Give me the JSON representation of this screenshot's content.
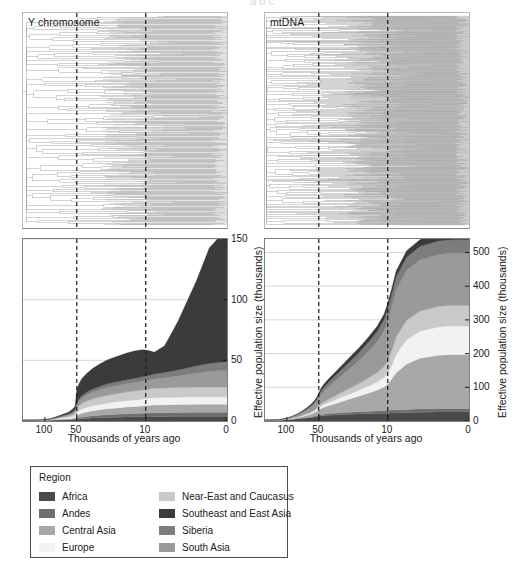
{
  "figure": {
    "cropped_header_text": "a  b  c",
    "panels": [
      {
        "id": "y",
        "title": "Y chromosome"
      },
      {
        "id": "mt",
        "title": "mtDNA"
      }
    ]
  },
  "axes": {
    "xlabel": "Thousands of years ago",
    "ylabel": "Effective population size (thousands)",
    "xticks": [
      "100",
      "50",
      "10",
      "0"
    ],
    "xtick_values": [
      100,
      50,
      10,
      0
    ],
    "left_yticks": [
      "0",
      "50",
      "100",
      "150"
    ],
    "right_yticks": [
      "0",
      "100",
      "200",
      "300",
      "400",
      "500"
    ],
    "dashed_marker_values": [
      50,
      10
    ]
  },
  "legend": {
    "title": "Region",
    "left_column": [
      {
        "label": "Africa",
        "color": "#4a4a4a"
      },
      {
        "label": "Andes",
        "color": "#6f6f6f"
      },
      {
        "label": "Central Asia",
        "color": "#a8a8a8"
      },
      {
        "label": "Europe",
        "color": "#f2f2f2"
      }
    ],
    "right_column": [
      {
        "label": "Near-East and Caucasus",
        "color": "#c9c9c9"
      },
      {
        "label": "Southeast and East Asia",
        "color": "#3b3b3b"
      },
      {
        "label": "Siberia",
        "color": "#7d7d7d"
      },
      {
        "label": "South Asia",
        "color": "#9a9a9a"
      }
    ]
  },
  "chart_data": [
    {
      "id": "y-chromosome",
      "type": "area",
      "title": "Y chromosome",
      "xlabel": "Thousands of years ago",
      "ylabel": "Effective population size (thousands)",
      "xlim": [
        160,
        0
      ],
      "ylim": [
        0,
        150
      ],
      "xscale": "log-reversed",
      "grid": true,
      "x": [
        160,
        140,
        120,
        100,
        90,
        80,
        70,
        60,
        55,
        52,
        50,
        48,
        45,
        40,
        35,
        30,
        25,
        20,
        16,
        13,
        11,
        10,
        9,
        8,
        6,
        4,
        2,
        1,
        0
      ],
      "series": [
        {
          "name": "Africa",
          "color": "#4a4a4a",
          "values": [
            0.6,
            0.6,
            0.6,
            0.7,
            0.7,
            0.8,
            0.9,
            1.0,
            1.1,
            1.2,
            1.4,
            1.6,
            1.8,
            2.1,
            2.4,
            2.6,
            2.8,
            3.0,
            3.2,
            3.4,
            3.5,
            3.6,
            3.7,
            3.8,
            3.8,
            3.9,
            4.0,
            4.0,
            4.0
          ]
        },
        {
          "name": "Andes",
          "color": "#6f6f6f",
          "values": [
            0.1,
            0.1,
            0.1,
            0.1,
            0.1,
            0.2,
            0.2,
            0.3,
            0.4,
            0.5,
            0.8,
            1.0,
            1.3,
            1.6,
            1.9,
            2.1,
            2.3,
            2.5,
            2.7,
            2.8,
            2.9,
            3.0,
            3.0,
            3.1,
            3.1,
            3.2,
            3.2,
            3.2,
            3.2
          ]
        },
        {
          "name": "Central Asia",
          "color": "#a8a8a8",
          "values": [
            0.0,
            0.0,
            0.0,
            0.1,
            0.1,
            0.2,
            0.4,
            0.6,
            0.8,
            1.0,
            2.0,
            2.6,
            3.2,
            3.8,
            4.2,
            4.6,
            5.0,
            5.3,
            5.6,
            5.8,
            6.0,
            6.1,
            6.2,
            6.3,
            6.4,
            6.5,
            6.6,
            6.6,
            6.6
          ]
        },
        {
          "name": "Europe",
          "color": "#f2f2f2",
          "values": [
            0.0,
            0.0,
            0.0,
            0.1,
            0.2,
            0.4,
            0.7,
            1.0,
            1.3,
            1.6,
            2.6,
            3.0,
            3.4,
            3.8,
            4.1,
            4.4,
            4.7,
            5.0,
            5.2,
            5.4,
            5.6,
            5.7,
            5.8,
            5.9,
            6.0,
            6.0,
            6.1,
            6.1,
            6.1
          ]
        },
        {
          "name": "Near-East and Caucasus",
          "color": "#c9c9c9",
          "values": [
            0.0,
            0.0,
            0.0,
            0.1,
            0.2,
            0.4,
            0.8,
            1.2,
            1.6,
            2.0,
            3.4,
            4.0,
            4.6,
            5.2,
            5.7,
            6.1,
            6.5,
            6.8,
            7.1,
            7.3,
            7.5,
            7.6,
            7.7,
            7.8,
            7.9,
            8.0,
            8.0,
            8.0,
            8.0
          ]
        },
        {
          "name": "South Asia",
          "color": "#9a9a9a",
          "values": [
            0.0,
            0.0,
            0.0,
            0.1,
            0.2,
            0.4,
            0.8,
            1.2,
            1.6,
            2.0,
            3.2,
            3.8,
            4.4,
            5.0,
            5.5,
            5.9,
            6.3,
            6.6,
            6.9,
            7.1,
            7.3,
            7.4,
            7.6,
            7.8,
            8.4,
            9.5,
            11.5,
            13.0,
            14.0
          ]
        },
        {
          "name": "Siberia",
          "color": "#7d7d7d",
          "values": [
            0.0,
            0.0,
            0.0,
            0.0,
            0.1,
            0.2,
            0.3,
            0.5,
            0.7,
            0.9,
            1.4,
            1.7,
            2.0,
            2.3,
            2.6,
            2.8,
            3.0,
            3.2,
            3.4,
            3.5,
            3.6,
            3.7,
            3.8,
            4.0,
            4.4,
            5.0,
            6.0,
            6.6,
            7.0
          ]
        },
        {
          "name": "Southeast and East Asia",
          "color": "#3b3b3b",
          "values": [
            0.0,
            0.0,
            0.0,
            0.1,
            0.3,
            0.6,
            1.0,
            1.5,
            2.2,
            3.0,
            11.0,
            12.5,
            14.0,
            15.5,
            17.0,
            18.5,
            19.8,
            21.0,
            22.0,
            22.5,
            22.3,
            21.5,
            20.0,
            18.0,
            22.0,
            40.0,
            70.0,
            95.0,
            110.0
          ]
        }
      ]
    },
    {
      "id": "mtdna",
      "type": "area",
      "title": "mtDNA",
      "xlabel": "Thousands of years ago",
      "ylabel": "Effective population size (thousands)",
      "xlim": [
        160,
        0
      ],
      "ylim": [
        0,
        540
      ],
      "xscale": "log-reversed",
      "grid": true,
      "x": [
        160,
        140,
        120,
        100,
        90,
        80,
        70,
        60,
        55,
        52,
        50,
        48,
        45,
        40,
        35,
        30,
        25,
        20,
        16,
        13,
        11,
        10,
        9,
        8,
        6,
        4,
        2,
        1,
        0
      ],
      "series": [
        {
          "name": "Africa",
          "color": "#4a4a4a",
          "values": [
            3,
            3,
            3,
            4,
            5,
            6,
            8,
            10,
            12,
            13,
            14,
            15,
            16,
            17,
            18,
            19,
            20,
            21,
            22,
            22,
            23,
            23,
            24,
            24,
            25,
            26,
            27,
            27,
            27
          ]
        },
        {
          "name": "Andes",
          "color": "#6f6f6f",
          "values": [
            0,
            0,
            0,
            0,
            0,
            1,
            1,
            2,
            2,
            3,
            3,
            4,
            4,
            5,
            5,
            6,
            6,
            7,
            7,
            8,
            8,
            8,
            9,
            9,
            9,
            10,
            10,
            10,
            10
          ]
        },
        {
          "name": "Central Asia",
          "color": "#a8a8a8",
          "values": [
            0,
            0,
            0,
            1,
            2,
            3,
            5,
            8,
            11,
            13,
            15,
            17,
            20,
            24,
            28,
            33,
            39,
            46,
            54,
            62,
            70,
            78,
            92,
            110,
            135,
            150,
            158,
            160,
            160
          ]
        },
        {
          "name": "Europe",
          "color": "#f2f2f2",
          "values": [
            0,
            0,
            0,
            0,
            1,
            1,
            2,
            3,
            4,
            5,
            6,
            7,
            8,
            9,
            11,
            13,
            15,
            18,
            21,
            24,
            28,
            32,
            40,
            55,
            72,
            80,
            84,
            85,
            85
          ]
        },
        {
          "name": "Near-East and Caucasus",
          "color": "#c9c9c9",
          "values": [
            0,
            0,
            0,
            0,
            1,
            1,
            2,
            3,
            4,
            5,
            6,
            7,
            8,
            10,
            12,
            14,
            17,
            20,
            24,
            28,
            33,
            38,
            45,
            52,
            58,
            60,
            61,
            61,
            61
          ]
        },
        {
          "name": "South Asia",
          "color": "#9a9a9a",
          "values": [
            0,
            0,
            1,
            2,
            3,
            5,
            8,
            13,
            17,
            20,
            24,
            27,
            31,
            37,
            43,
            50,
            58,
            68,
            80,
            92,
            106,
            118,
            130,
            140,
            148,
            152,
            154,
            155,
            155
          ]
        },
        {
          "name": "Siberia",
          "color": "#7d7d7d",
          "values": [
            0,
            0,
            0,
            1,
            1,
            2,
            3,
            5,
            6,
            7,
            9,
            10,
            12,
            14,
            16,
            18,
            21,
            24,
            27,
            30,
            33,
            35,
            37,
            38,
            39,
            40,
            40,
            40,
            40
          ]
        },
        {
          "name": "Southeast and East Asia",
          "color": "#3b3b3b",
          "values": [
            0,
            0,
            0,
            1,
            1,
            2,
            3,
            4,
            5,
            6,
            7,
            8,
            9,
            10,
            11,
            12,
            13,
            14,
            15,
            16,
            16,
            17,
            17,
            18,
            19,
            20,
            21,
            21,
            21
          ]
        }
      ]
    }
  ],
  "trees": [
    {
      "id": "y-chromosome-tree",
      "type": "phylogram",
      "tips": 170,
      "density": "moderate"
    },
    {
      "id": "mtdna-tree",
      "type": "phylogram",
      "tips": 330,
      "density": "high"
    }
  ]
}
